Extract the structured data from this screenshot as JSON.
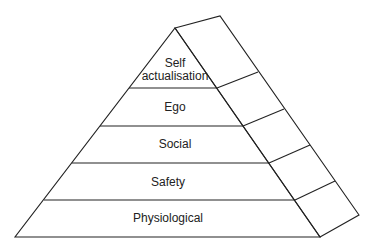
{
  "diagram": {
    "type": "pyramid",
    "levels": [
      {
        "label_line1": "Self",
        "label_line2": "actualisation"
      },
      {
        "label": "Ego"
      },
      {
        "label": "Social"
      },
      {
        "label": "Safety"
      },
      {
        "label": "Physiological"
      }
    ],
    "colors": {
      "stroke": "#222222",
      "fill": "#ffffff",
      "text": "#222222"
    }
  }
}
